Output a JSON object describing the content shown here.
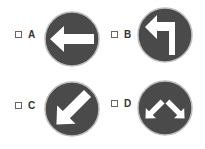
{
  "options": [
    {
      "label": "A",
      "sign": "arrow-left",
      "checked": false
    },
    {
      "label": "B",
      "sign": "arrow-turn-left",
      "checked": false
    },
    {
      "label": "C",
      "sign": "arrow-down-left",
      "checked": false
    },
    {
      "label": "D",
      "sign": "arrows-split-down",
      "checked": false
    }
  ],
  "colors": {
    "sign_fill": "#4a4a4a",
    "sign_border": "#bdbdbd",
    "arrow": "#ffffff"
  }
}
